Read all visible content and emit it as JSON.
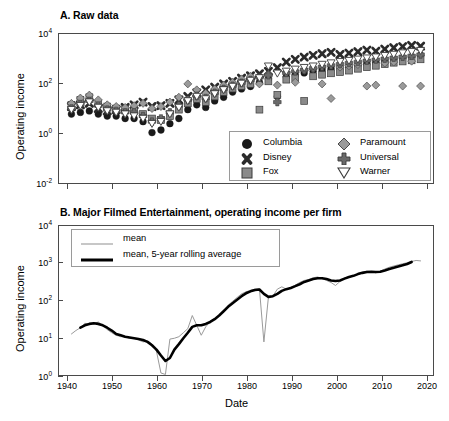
{
  "figure": {
    "background": "#ffffff",
    "width": 449,
    "height": 421
  },
  "panelA": {
    "title": "A. Raw data",
    "ylabel": "Operating income",
    "xlabel": "",
    "ytick_labels": [
      "10",
      "10",
      "10",
      "10"
    ],
    "ytick_exponents": [
      "4",
      "2",
      "0",
      "-2"
    ],
    "legend": {
      "entries": [
        {
          "label": "Columbia",
          "marker": "circle-filled",
          "color": "#1a1a1a"
        },
        {
          "label": "Disney",
          "marker": "x-cross-filled",
          "color": "#2b2b2b"
        },
        {
          "label": "Fox",
          "marker": "square-gray",
          "color": "#8a8a8a"
        },
        {
          "label": "Paramount",
          "marker": "diamond-gray",
          "color": "#9a9a9a"
        },
        {
          "label": "Universal",
          "marker": "plus-cross",
          "color": "#6a6a6a"
        },
        {
          "label": "Warner",
          "marker": "triangle-down-open",
          "color": "#ffffff"
        }
      ]
    }
  },
  "panelB": {
    "title": "B. Major Filmed Entertainment, operating income per firm",
    "ylabel": "Operating income",
    "xlabel": "Date",
    "ytick_labels": [
      "10",
      "10",
      "10",
      "10",
      "10"
    ],
    "ytick_exponents": [
      "4",
      "3",
      "2",
      "1",
      "0"
    ],
    "xtick_labels": [
      "1940",
      "1950",
      "1960",
      "1970",
      "1980",
      "1990",
      "2000",
      "2010",
      "2020"
    ],
    "legend": {
      "entries": [
        {
          "label": "mean",
          "style": "thin-gray-line",
          "color": "#9a9a9a"
        },
        {
          "label": "mean, 5-year rolling average",
          "style": "thick-black-line",
          "color": "#000000"
        }
      ]
    }
  },
  "chart_data": [
    {
      "type": "scatter",
      "title": "A. Raw data",
      "xlabel": "",
      "ylabel": "Operating income",
      "yscale": "log",
      "ylim": [
        0.01,
        10000
      ],
      "xlim": [
        1938,
        2022
      ],
      "yticks": [
        0.01,
        1,
        100,
        10000
      ],
      "xticks": [
        1940,
        1950,
        1960,
        1970,
        1980,
        1990,
        2000,
        2010,
        2020
      ],
      "grid": false,
      "legend_position": "inside-lower-right",
      "series": [
        {
          "name": "Columbia",
          "marker": "circle-filled",
          "color": "#1a1a1a",
          "x": [
            1941,
            1943,
            1945,
            1947,
            1949,
            1951,
            1953,
            1955,
            1957,
            1959,
            1961,
            1963,
            1965,
            1967,
            1969,
            1971,
            1973,
            1975,
            1977,
            1979,
            1981,
            1983,
            1985,
            1987,
            1989,
            1991,
            1993,
            1995,
            1997,
            1999,
            2001,
            2003,
            2005,
            2007,
            2009,
            2011,
            2013,
            2015,
            2017,
            2019
          ],
          "y": [
            6,
            7,
            8,
            6,
            5,
            5,
            4,
            4,
            3,
            1.1,
            1.4,
            2.5,
            4,
            9,
            14,
            11,
            20,
            28,
            45,
            60,
            75,
            110,
            150,
            30,
            180,
            220,
            260,
            300,
            340,
            380,
            420,
            480,
            540,
            600,
            680,
            760,
            850,
            950,
            1100,
            1300
          ]
        },
        {
          "name": "Disney",
          "marker": "x-cross-filled",
          "color": "#2b2b2b",
          "x": [
            1941,
            1943,
            1945,
            1947,
            1949,
            1951,
            1953,
            1955,
            1957,
            1959,
            1961,
            1963,
            1965,
            1967,
            1969,
            1971,
            1973,
            1975,
            1977,
            1979,
            1981,
            1983,
            1985,
            1987,
            1989,
            1991,
            1993,
            1995,
            1997,
            1999,
            2001,
            2003,
            2005,
            2007,
            2009,
            2011,
            2013,
            2015,
            2017,
            2019
          ],
          "y": [
            12,
            14,
            16,
            10,
            8,
            9,
            11,
            14,
            18,
            12,
            13,
            16,
            22,
            30,
            42,
            55,
            70,
            95,
            120,
            160,
            200,
            240,
            300,
            420,
            700,
            900,
            1100,
            1300,
            1500,
            1700,
            1400,
            1600,
            1800,
            2100,
            1900,
            2300,
            2600,
            2900,
            3200,
            3000
          ]
        },
        {
          "name": "Fox",
          "marker": "square-gray",
          "color": "#8a8a8a",
          "x": [
            1941,
            1943,
            1945,
            1947,
            1949,
            1951,
            1953,
            1955,
            1957,
            1959,
            1961,
            1963,
            1965,
            1967,
            1969,
            1971,
            1973,
            1975,
            1977,
            1979,
            1981,
            1983,
            1985,
            1987,
            1989,
            1991,
            1993,
            1995,
            1997,
            1999,
            2001,
            2003,
            2005,
            2007,
            2009,
            2011,
            2013,
            2015,
            2017,
            2019
          ],
          "y": [
            14,
            22,
            28,
            16,
            12,
            10,
            9,
            8,
            6,
            4,
            3.5,
            5,
            9,
            16,
            24,
            18,
            30,
            45,
            62,
            78,
            95,
            9,
            120,
            35,
            140,
            160,
            20,
            190,
            220,
            250,
            280,
            320,
            380,
            440,
            500,
            580,
            660,
            740,
            820,
            900
          ]
        },
        {
          "name": "Paramount",
          "marker": "diamond-gray",
          "color": "#9a9a9a",
          "x": [
            1941,
            1943,
            1945,
            1947,
            1949,
            1951,
            1953,
            1955,
            1957,
            1959,
            1961,
            1963,
            1965,
            1967,
            1969,
            1971,
            1973,
            1975,
            1977,
            1979,
            1981,
            1983,
            1985,
            1987,
            1989,
            1991,
            1993,
            1995,
            1997,
            1999,
            2001,
            2003,
            2005,
            2007,
            2009,
            2011,
            2013,
            2015,
            2017,
            2019
          ],
          "y": [
            16,
            26,
            34,
            22,
            14,
            12,
            11,
            13,
            16,
            10,
            12,
            18,
            28,
            95,
            55,
            40,
            60,
            85,
            110,
            150,
            190,
            95,
            230,
            85,
            280,
            110,
            330,
            380,
            95,
            25,
            440,
            500,
            560,
            78,
            85,
            640,
            700,
            78,
            760,
            78
          ]
        },
        {
          "name": "Universal",
          "marker": "plus-cross",
          "color": "#6a6a6a",
          "x": [
            1941,
            1943,
            1945,
            1947,
            1949,
            1951,
            1953,
            1955,
            1957,
            1959,
            1961,
            1963,
            1965,
            1967,
            1969,
            1971,
            1973,
            1975,
            1977,
            1979,
            1981,
            1983,
            1985,
            1987,
            1989,
            1991,
            1993,
            1995,
            1997,
            1999,
            2001,
            2003,
            2005,
            2007,
            2009,
            2011,
            2013,
            2015,
            2017,
            2019
          ],
          "y": [
            10,
            15,
            20,
            13,
            9,
            8,
            7,
            7,
            5,
            3,
            4,
            7,
            13,
            22,
            32,
            26,
            42,
            60,
            80,
            105,
            135,
            170,
            210,
            18,
            260,
            300,
            350,
            400,
            460,
            520,
            580,
            650,
            720,
            800,
            880,
            960,
            1050,
            1150,
            1250,
            1400
          ]
        },
        {
          "name": "Warner",
          "marker": "triangle-down-open",
          "color": "#ffffff",
          "x": [
            1941,
            1943,
            1945,
            1947,
            1949,
            1951,
            1953,
            1955,
            1957,
            1959,
            1961,
            1963,
            1965,
            1967,
            1969,
            1971,
            1973,
            1975,
            1977,
            1979,
            1981,
            1983,
            1985,
            1987,
            1989,
            1991,
            1993,
            1995,
            1997,
            1999,
            2001,
            2003,
            2005,
            2007,
            2009,
            2011,
            2013,
            2015,
            2017,
            2019
          ],
          "y": [
            9,
            13,
            18,
            11,
            8,
            7,
            6,
            5,
            4,
            2.5,
            3,
            6,
            11,
            20,
            30,
            24,
            38,
            55,
            75,
            100,
            130,
            165,
            480,
            250,
            300,
            360,
            420,
            480,
            560,
            640,
            720,
            800,
            900,
            1000,
            1100,
            1250,
            1400,
            1600,
            1800,
            2000
          ]
        }
      ]
    },
    {
      "type": "line",
      "title": "B. Major Filmed Entertainment, operating income per firm",
      "xlabel": "Date",
      "ylabel": "Operating income",
      "yscale": "log",
      "ylim": [
        1,
        10000
      ],
      "xlim": [
        1938,
        2022
      ],
      "yticks": [
        1,
        10,
        100,
        1000,
        10000
      ],
      "xticks": [
        1940,
        1950,
        1960,
        1970,
        1980,
        1990,
        2000,
        2010,
        2020
      ],
      "grid": false,
      "legend_position": "inside-upper-left",
      "series": [
        {
          "name": "mean",
          "style": "thin-gray-line",
          "color": "#9a9a9a",
          "x": [
            1941,
            1942,
            1943,
            1944,
            1945,
            1946,
            1947,
            1948,
            1949,
            1950,
            1951,
            1952,
            1953,
            1954,
            1955,
            1956,
            1957,
            1958,
            1959,
            1960,
            1961,
            1962,
            1963,
            1964,
            1965,
            1966,
            1967,
            1968,
            1969,
            1970,
            1971,
            1972,
            1973,
            1974,
            1975,
            1976,
            1977,
            1978,
            1979,
            1980,
            1981,
            1982,
            1983,
            1984,
            1985,
            1986,
            1987,
            1988,
            1989,
            1990,
            1991,
            1992,
            1993,
            1994,
            1995,
            1996,
            1997,
            1998,
            1999,
            2000,
            2001,
            2002,
            2003,
            2004,
            2005,
            2006,
            2007,
            2008,
            2009,
            2010,
            2011,
            2012,
            2013,
            2014,
            2015,
            2016,
            2017,
            2018,
            2019
          ],
          "y": [
            13,
            16,
            19,
            25,
            23,
            24,
            27,
            22,
            17,
            14,
            12,
            11,
            11,
            10,
            10,
            9,
            8,
            8.5,
            7,
            4.5,
            1.2,
            1.1,
            9.5,
            10,
            11,
            14,
            18,
            40,
            22,
            12,
            20,
            28,
            32,
            40,
            55,
            75,
            95,
            120,
            150,
            170,
            185,
            200,
            205,
            8,
            120,
            130,
            200,
            230,
            200,
            215,
            255,
            300,
            340,
            360,
            400,
            420,
            380,
            340,
            300,
            250,
            320,
            400,
            420,
            440,
            520,
            560,
            600,
            580,
            540,
            600,
            680,
            760,
            820,
            880,
            940,
            1000,
            1080,
            1150,
            1120
          ]
        },
        {
          "name": "mean, 5-year rolling average",
          "style": "thick-black-line",
          "color": "#000000",
          "x": [
            1943,
            1944,
            1945,
            1946,
            1947,
            1948,
            1949,
            1950,
            1951,
            1952,
            1953,
            1954,
            1955,
            1956,
            1957,
            1958,
            1959,
            1960,
            1961,
            1962,
            1963,
            1964,
            1965,
            1966,
            1967,
            1968,
            1969,
            1970,
            1971,
            1972,
            1973,
            1974,
            1975,
            1976,
            1977,
            1978,
            1979,
            1980,
            1981,
            1982,
            1983,
            1984,
            1985,
            1986,
            1987,
            1988,
            1989,
            1990,
            1991,
            1992,
            1993,
            1994,
            1995,
            1996,
            1997,
            1998,
            1999,
            2000,
            2001,
            2002,
            2003,
            2004,
            2005,
            2006,
            2007,
            2008,
            2009,
            2010,
            2011,
            2012,
            2013,
            2014,
            2015,
            2016,
            2017
          ],
          "y": [
            19,
            22,
            24,
            25,
            24,
            22,
            19,
            16,
            13,
            12,
            11,
            10.5,
            10,
            9.5,
            9,
            8,
            6.5,
            5,
            3.5,
            2.5,
            3,
            5,
            7,
            10,
            14,
            20,
            22,
            22,
            24,
            27,
            32,
            40,
            52,
            68,
            85,
            105,
            130,
            155,
            175,
            190,
            195,
            150,
            125,
            130,
            150,
            180,
            200,
            215,
            240,
            270,
            310,
            340,
            370,
            390,
            390,
            370,
            340,
            330,
            340,
            380,
            420,
            450,
            500,
            540,
            570,
            580,
            570,
            580,
            620,
            680,
            740,
            800,
            860,
            930,
            1050
          ]
        }
      ]
    }
  ]
}
